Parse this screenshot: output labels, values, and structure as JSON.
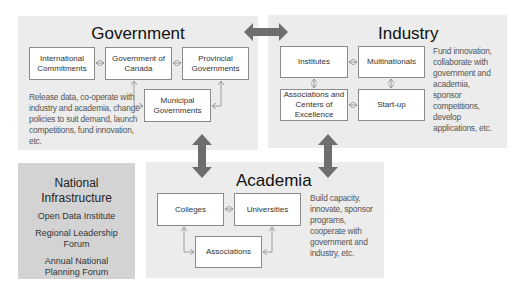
{
  "government": {
    "title": "Government",
    "nodes": {
      "international": "International Commitments",
      "canada": "Government of Canada",
      "provincial": "Provincial Governments",
      "municipal": "Municipal Governments"
    },
    "description": "Release data, co-operate with industry and academia, change policies to suit demand, launch competitions, fund innovation, etc."
  },
  "industry": {
    "title": "Industry",
    "nodes": {
      "institutes": "Institutes",
      "multinationals": "Multinationals",
      "associations": "Associations and Centers of Excellence",
      "startup": "Start-up"
    },
    "description": "Fund innovation, collaborate with government and academia, sponsor competitions, develop applications, etc."
  },
  "academia": {
    "title": "Academia",
    "nodes": {
      "colleges": "Colleges",
      "universities": "Universities",
      "associations": "Associations"
    },
    "description": "Build capacity, innovate, sponsor programs, cooperate with government and industry, etc."
  },
  "national": {
    "title": "National Infrastructure",
    "items": [
      "Open Data Institute",
      "Regional Leadership Forum",
      "Annual National Planning Forum"
    ]
  },
  "colors": {
    "panel": "#ececec",
    "national_panel": "#d3d3d3",
    "big_arrow": "#6e6e6e",
    "connector": "#8a8a8a"
  }
}
